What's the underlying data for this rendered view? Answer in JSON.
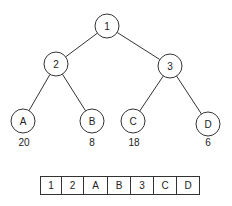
{
  "tree": {
    "nodes": [
      {
        "id": "1",
        "label": "1",
        "x": 107,
        "y": 26
      },
      {
        "id": "2",
        "label": "2",
        "x": 56,
        "y": 64
      },
      {
        "id": "3",
        "label": "3",
        "x": 170,
        "y": 66
      },
      {
        "id": "A",
        "label": "A",
        "x": 23,
        "y": 121
      },
      {
        "id": "B",
        "label": "B",
        "x": 92,
        "y": 121
      },
      {
        "id": "C",
        "label": "C",
        "x": 133,
        "y": 121
      },
      {
        "id": "D",
        "label": "D",
        "x": 208,
        "y": 124
      }
    ],
    "edges": [
      {
        "from": "1",
        "to": "2"
      },
      {
        "from": "1",
        "to": "3"
      },
      {
        "from": "2",
        "to": "A"
      },
      {
        "from": "2",
        "to": "B"
      },
      {
        "from": "3",
        "to": "C"
      },
      {
        "from": "3",
        "to": "D"
      }
    ],
    "leaf_weights": [
      {
        "node": "A",
        "value": "20",
        "x": 24,
        "y": 137
      },
      {
        "node": "B",
        "value": "8",
        "x": 92,
        "y": 137
      },
      {
        "node": "C",
        "value": "18",
        "x": 134,
        "y": 137
      },
      {
        "node": "D",
        "value": "6",
        "x": 208,
        "y": 137
      }
    ]
  },
  "array": {
    "cells": [
      "1",
      "2",
      "A",
      "B",
      "3",
      "C",
      "D"
    ],
    "widths": [
      21,
      22,
      24,
      23,
      23,
      23,
      22
    ]
  }
}
